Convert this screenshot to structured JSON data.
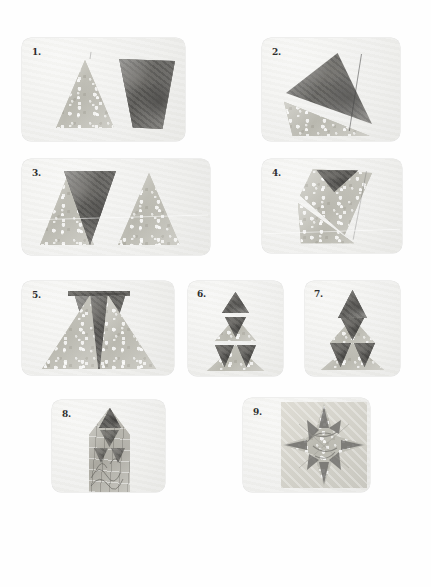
{
  "page": {
    "background_color": "#ffffff",
    "width": 431,
    "height": 587
  },
  "palette": {
    "page_bg": "#ffffff",
    "panel_bg": "#f1f1ef",
    "fabric_light": "#bfbeb6",
    "fabric_dark": "#6f6e6b",
    "fabric_print": "#b3b2aa",
    "number_color": "#2d2d2d"
  },
  "steps": [
    {
      "number": "1.",
      "caption": "Light dotted triangle beside dark marbled inverted triangle",
      "panel": {
        "x": 22,
        "y": 38,
        "w": 163,
        "h": 103
      }
    },
    {
      "number": "2.",
      "caption": "Two triangles layered right sides together with stitched seam",
      "panel": {
        "x": 262,
        "y": 38,
        "w": 138,
        "h": 103
      }
    },
    {
      "number": "3.",
      "caption": "Three pieced triangles laid side by side",
      "panel": {
        "x": 22,
        "y": 159,
        "w": 188,
        "h": 96
      }
    },
    {
      "number": "4.",
      "caption": "Folded unit turned on point showing dark corner",
      "panel": {
        "x": 262,
        "y": 159,
        "w": 140,
        "h": 94
      }
    },
    {
      "number": "5.",
      "caption": "Unit opened flat with dark V between two light triangles",
      "panel": {
        "x": 22,
        "y": 281,
        "w": 152,
        "h": 94
      }
    },
    {
      "number": "6.",
      "caption": "Three graded triangle units stacked in a column",
      "panel": {
        "x": 188,
        "y": 281,
        "w": 95,
        "h": 95
      }
    },
    {
      "number": "7.",
      "caption": "Units joined into a single large pyramid triangle",
      "panel": {
        "x": 305,
        "y": 281,
        "w": 95,
        "h": 95
      }
    },
    {
      "number": "8.",
      "caption": "Pyramid point sewn onto printed background strip",
      "panel": {
        "x": 52,
        "y": 400,
        "w": 113,
        "h": 92
      }
    },
    {
      "number": "9.",
      "caption": "Completed four-pointed star block",
      "panel": {
        "x": 243,
        "y": 398,
        "w": 127,
        "h": 94
      }
    }
  ]
}
